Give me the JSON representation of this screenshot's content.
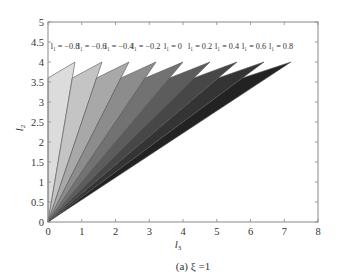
{
  "chart_data": {
    "type": "area",
    "title": "",
    "caption": "(a) ξ =1",
    "xlabel": "l3",
    "ylabel": "l2",
    "xlim": [
      0,
      8
    ],
    "ylim": [
      0,
      5
    ],
    "xticks": [
      0,
      1,
      2,
      3,
      4,
      5,
      6,
      7,
      8
    ],
    "yticks": [
      0,
      0.5,
      1,
      1.5,
      2,
      2.5,
      3,
      3.5,
      4,
      4.5,
      5
    ],
    "ytick_labels": [
      "0",
      "0.5",
      "1",
      "1.5",
      "2",
      "2.5",
      "3",
      "3.5",
      "4",
      "4.5",
      "5"
    ],
    "grid": false,
    "legend": "inline annotations above wedges",
    "series": [
      {
        "name": "l1 = -0.8",
        "label": "l₁ = −0.8",
        "polygon": [
          [
            0,
            0
          ],
          [
            0,
            3.6
          ],
          [
            0.8,
            4
          ],
          [
            0,
            0
          ]
        ],
        "fill": "#dcdcdc"
      },
      {
        "name": "l1 = -0.6",
        "label": "l₁ = −0.6",
        "polygon": [
          [
            0,
            0
          ],
          [
            0.72,
            3.6
          ],
          [
            1.6,
            4
          ],
          [
            0,
            0
          ]
        ],
        "fill": "#c4c4c4"
      },
      {
        "name": "l1 = -0.4",
        "label": "l₁ = −0.4",
        "polygon": [
          [
            0,
            0
          ],
          [
            1.44,
            3.6
          ],
          [
            2.4,
            4
          ],
          [
            0,
            0
          ]
        ],
        "fill": "#a8a8a8"
      },
      {
        "name": "l1 = -0.2",
        "label": "l₁ = −0.2",
        "polygon": [
          [
            0,
            0
          ],
          [
            2.16,
            3.6
          ],
          [
            3.2,
            4
          ],
          [
            0,
            0
          ]
        ],
        "fill": "#8c8c8c"
      },
      {
        "name": "l1 = 0",
        "label": "l₁ = 0",
        "polygon": [
          [
            0,
            0
          ],
          [
            2.88,
            3.6
          ],
          [
            4.0,
            4
          ],
          [
            0,
            0
          ]
        ],
        "fill": "#727272"
      },
      {
        "name": "l1 = 0.2",
        "label": "l₁ = 0.2",
        "polygon": [
          [
            0,
            0
          ],
          [
            3.6,
            3.6
          ],
          [
            4.8,
            4
          ],
          [
            0,
            0
          ]
        ],
        "fill": "#5c5c5c"
      },
      {
        "name": "l1 = 0.4",
        "label": "l₁ = 0.4",
        "polygon": [
          [
            0,
            0
          ],
          [
            4.32,
            3.6
          ],
          [
            5.6,
            4
          ],
          [
            0,
            0
          ]
        ],
        "fill": "#474747"
      },
      {
        "name": "l1 = 0.6",
        "label": "l₁ = 0.6",
        "polygon": [
          [
            0,
            0
          ],
          [
            5.04,
            3.6
          ],
          [
            6.4,
            4
          ],
          [
            0,
            0
          ]
        ],
        "fill": "#343434"
      },
      {
        "name": "l1 = 0.8",
        "label": "l₁ = 0.8",
        "polygon": [
          [
            0,
            0
          ],
          [
            5.76,
            3.6
          ],
          [
            7.2,
            4
          ],
          [
            0,
            0
          ]
        ],
        "fill": "#222222"
      }
    ],
    "annotation_y": 4.4
  },
  "labels": {
    "xlabel_text": "l",
    "xlabel_sub": "3",
    "ylabel_text": "l",
    "ylabel_sub": "2",
    "caption": "(a) ξ =1"
  }
}
